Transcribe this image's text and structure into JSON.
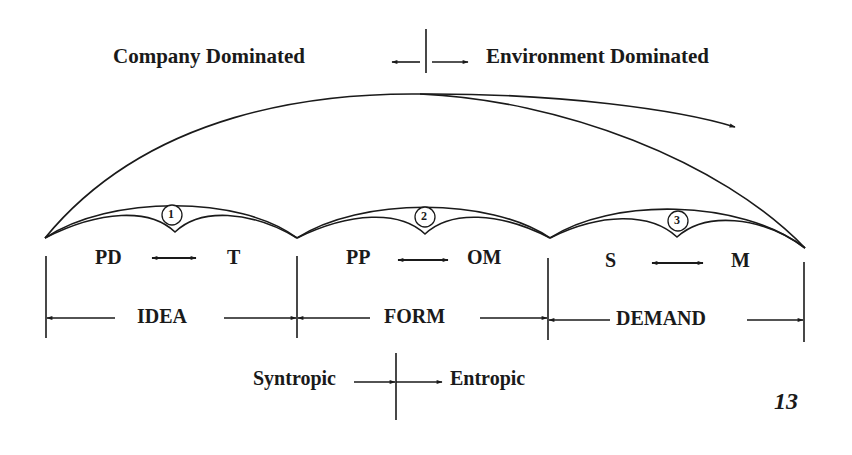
{
  "diagram": {
    "top_axis": {
      "left_label": "Company Dominated",
      "right_label": "Environment Dominated"
    },
    "stages": [
      {
        "number": "1",
        "left": "PD",
        "right": "T",
        "phase": "IDEA"
      },
      {
        "number": "2",
        "left": "PP",
        "right": "OM",
        "phase": "FORM"
      },
      {
        "number": "3",
        "left": "S",
        "right": "M",
        "phase": "DEMAND"
      }
    ],
    "bottom_axis": {
      "left_label": "Syntropic",
      "right_label": "Entropic"
    },
    "page_number": "13",
    "colors": {
      "ink": "#1a1a1a",
      "background": "#ffffff"
    }
  }
}
